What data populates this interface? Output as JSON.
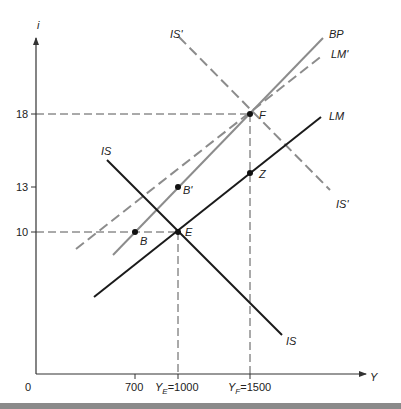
{
  "diagram": {
    "type": "IS-LM-BP macroeconomic diagram",
    "axes": {
      "y_label": "i",
      "x_label": "Y",
      "origin_label": "0",
      "y_ticks": [
        {
          "label": "18",
          "value": 18
        },
        {
          "label": "13",
          "value": 13
        },
        {
          "label": "10",
          "value": 10
        }
      ],
      "x_ticks": [
        {
          "label": "700",
          "value": 700
        },
        {
          "label": "Y_E = 1000",
          "value": 1000,
          "sym": "Y",
          "sub": "E",
          "eq": "=1000"
        },
        {
          "label": "Y_F = 1500",
          "value": 1500,
          "sym": "Y",
          "sub": "F",
          "eq": "=1500"
        }
      ]
    },
    "curves": [
      {
        "name": "IS",
        "style": "solid",
        "color": "#1a1a1a",
        "labels": [
          "IS",
          "IS"
        ]
      },
      {
        "name": "LM",
        "style": "solid",
        "color": "#1a1a1a",
        "labels": [
          "LM"
        ]
      },
      {
        "name": "BP",
        "style": "solid",
        "color": "#8c8c8c",
        "labels": [
          "BP"
        ]
      },
      {
        "name": "LM'",
        "style": "dashed",
        "color": "#8c8c8c",
        "labels": [
          "LM'"
        ]
      },
      {
        "name": "IS'",
        "style": "dashed",
        "color": "#8c8c8c",
        "labels": [
          "IS'",
          "IS'"
        ]
      }
    ],
    "points": [
      {
        "label": "B",
        "Y": 700,
        "i": 10
      },
      {
        "label": "E",
        "Y": 1000,
        "i": 10
      },
      {
        "label": "B'",
        "Y": 1000,
        "i": 13
      },
      {
        "label": "F",
        "Y": 1500,
        "i": 18
      },
      {
        "label": "Z",
        "Y": 1500,
        "i": 14
      }
    ],
    "colors": {
      "axis": "#333333",
      "primary_curve": "#1a1a1a",
      "shifted_curve": "#8c8c8c",
      "guide_dash": "#555555",
      "bottom_bar": "#8a8a8a"
    }
  }
}
